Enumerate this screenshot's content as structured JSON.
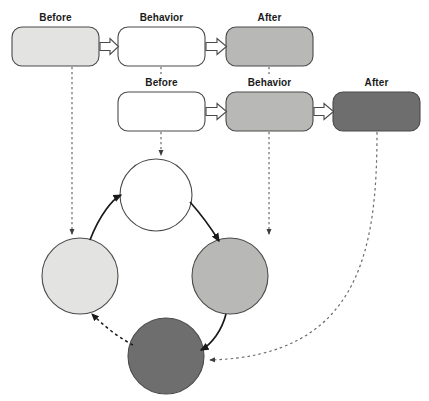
{
  "diagram": {
    "colors": {
      "shade_white": "#ffffff",
      "shade_light": "#e3e3e1",
      "shade_medium": "#b8b8b6",
      "shade_dark": "#6e6e6e",
      "stroke": "#4a4a4a",
      "label_text": "#1a1a1a",
      "arrow_solid": "#1a1a1a",
      "arrow_dashed": "#5a5a5a"
    },
    "rows": [
      {
        "name": "row-1",
        "boxes": [
          {
            "label": "Before",
            "fill": "#e3e3e1",
            "x": 12,
            "y": 27,
            "w": 87,
            "h": 39
          },
          {
            "label": "Behavior",
            "fill": "#ffffff",
            "x": 118,
            "y": 27,
            "w": 87,
            "h": 39
          },
          {
            "label": "After",
            "fill": "#b8b8b6",
            "x": 226,
            "y": 27,
            "w": 87,
            "h": 39
          }
        ]
      },
      {
        "name": "row-2",
        "boxes": [
          {
            "label": "Before",
            "fill": "#ffffff",
            "x": 118,
            "y": 92,
            "w": 87,
            "h": 39
          },
          {
            "label": "Behavior",
            "fill": "#b8b8b6",
            "x": 226,
            "y": 92,
            "w": 87,
            "h": 39
          },
          {
            "label": "After",
            "fill": "#6e6e6e",
            "x": 333,
            "y": 92,
            "w": 87,
            "h": 39
          }
        ]
      }
    ],
    "cycle": {
      "name": "reinforcement-cycle",
      "circles": [
        {
          "name": "circle-top",
          "fill": "#ffffff",
          "cx": 156,
          "cy": 195,
          "r": 36
        },
        {
          "name": "circle-left",
          "fill": "#e3e3e1",
          "cx": 80,
          "cy": 276,
          "r": 38
        },
        {
          "name": "circle-right",
          "fill": "#b8b8b6",
          "cx": 230,
          "cy": 276,
          "r": 38
        },
        {
          "name": "circle-bottom",
          "fill": "#6e6e6e",
          "cx": 166,
          "cy": 356,
          "r": 38
        }
      ]
    },
    "connectors": {
      "block_arrows": [
        {
          "name": "block-arrow-row1-before-to-behavior",
          "from": "row1-before",
          "to": "row1-behavior"
        },
        {
          "name": "block-arrow-row1-behavior-to-after",
          "from": "row1-behavior",
          "to": "row1-after"
        },
        {
          "name": "block-arrow-row2-before-to-behavior",
          "from": "row2-before",
          "to": "row2-behavior"
        },
        {
          "name": "block-arrow-row2-behavior-to-after",
          "from": "row2-behavior",
          "to": "row2-after"
        }
      ],
      "dashed_drops": [
        {
          "name": "dashed-row1-before-to-circle-left",
          "x": 72
        },
        {
          "name": "dashed-row2-before-to-circle-top",
          "x": 161
        },
        {
          "name": "dashed-row2-behavior-to-circle-right",
          "x": 269
        }
      ],
      "dashed_curve": {
        "name": "dashed-row2-after-to-circle-bottom"
      },
      "cycle_arrows": [
        {
          "name": "cycle-arrow-left-to-top",
          "style": "solid"
        },
        {
          "name": "cycle-arrow-top-to-right",
          "style": "solid"
        },
        {
          "name": "cycle-arrow-right-to-bottom",
          "style": "solid"
        },
        {
          "name": "cycle-arrow-bottom-to-left",
          "style": "dashed"
        }
      ]
    }
  }
}
